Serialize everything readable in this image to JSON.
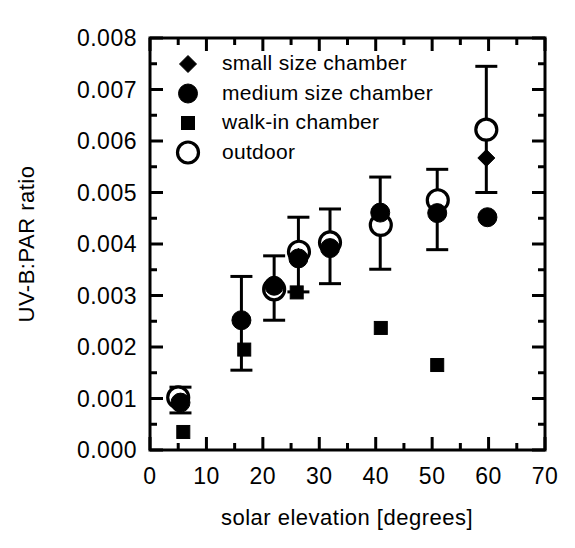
{
  "chart_data": {
    "type": "scatter",
    "title": "",
    "xlabel": "solar elevation [degrees]",
    "ylabel": "UV-B:PAR ratio",
    "xlim": [
      0,
      70
    ],
    "ylim": [
      0.0,
      0.008
    ],
    "xticks": [
      0,
      10,
      20,
      30,
      40,
      50,
      60,
      70
    ],
    "xtick_labels": [
      "0",
      "10",
      "20",
      "30",
      "40",
      "50",
      "60",
      "70"
    ],
    "yticks": [
      0.0,
      0.001,
      0.002,
      0.003,
      0.004,
      0.005,
      0.006,
      0.007,
      0.008
    ],
    "ytick_labels": [
      "0.000",
      "0.001",
      "0.002",
      "0.003",
      "0.004",
      "0.005",
      "0.006",
      "0.007",
      "0.008"
    ],
    "grid": false,
    "legend_position": "upper-left-inside",
    "series": [
      {
        "name": "small size chamber",
        "marker": "diamond",
        "fill": "solid",
        "points": [
          {
            "x": 5.2,
            "y": 0.00088
          },
          {
            "x": 26.3,
            "y": 0.00375
          },
          {
            "x": 31.8,
            "y": 0.00393
          },
          {
            "x": 59.6,
            "y": 0.00567
          }
        ]
      },
      {
        "name": "medium size chamber",
        "marker": "circle",
        "fill": "solid",
        "points": [
          {
            "x": 5.4,
            "y": 0.00092,
            "err_low": 0.00072,
            "err_high": 0.00122
          },
          {
            "x": 16.2,
            "y": 0.00252,
            "err_low": 0.00155,
            "err_high": 0.00337
          },
          {
            "x": 22.0,
            "y": 0.00319,
            "err_low": 0.00252,
            "err_high": 0.00377
          },
          {
            "x": 26.3,
            "y": 0.00372,
            "err_low": 0.00307,
            "err_high": 0.00452
          },
          {
            "x": 31.9,
            "y": 0.00392,
            "err_low": 0.00323,
            "err_high": 0.00468
          },
          {
            "x": 40.8,
            "y": 0.00461,
            "err_low": 0.00351,
            "err_high": 0.0053
          },
          {
            "x": 50.9,
            "y": 0.0046,
            "err_low": 0.00389,
            "err_high": 0.00545
          },
          {
            "x": 59.8,
            "y": 0.00452
          }
        ]
      },
      {
        "name": "walk-in chamber",
        "marker": "square",
        "fill": "solid",
        "points": [
          {
            "x": 5.9,
            "y": 0.00035
          },
          {
            "x": 16.7,
            "y": 0.00195
          },
          {
            "x": 26.0,
            "y": 0.00306
          },
          {
            "x": 40.9,
            "y": 0.00237
          },
          {
            "x": 50.9,
            "y": 0.00165
          }
        ]
      },
      {
        "name": "outdoor",
        "marker": "circle",
        "fill": "open",
        "points": [
          {
            "x": 5.0,
            "y": 0.00102
          },
          {
            "x": 22.0,
            "y": 0.00312
          },
          {
            "x": 26.4,
            "y": 0.00385
          },
          {
            "x": 31.9,
            "y": 0.00403
          },
          {
            "x": 40.9,
            "y": 0.00437
          },
          {
            "x": 51.0,
            "y": 0.00485
          },
          {
            "x": 59.6,
            "y": 0.00622,
            "err_low": 0.005,
            "err_high": 0.00745
          }
        ]
      }
    ]
  },
  "legend": {
    "entries": [
      {
        "label": "small size chamber",
        "marker": "diamond-icon"
      },
      {
        "label": "medium size chamber",
        "marker": "filled-circle-icon"
      },
      {
        "label": "walk-in chamber",
        "marker": "filled-square-icon"
      },
      {
        "label": "outdoor",
        "marker": "open-circle-icon"
      }
    ]
  },
  "colors": {
    "ink": "#000000",
    "background": "#ffffff"
  }
}
